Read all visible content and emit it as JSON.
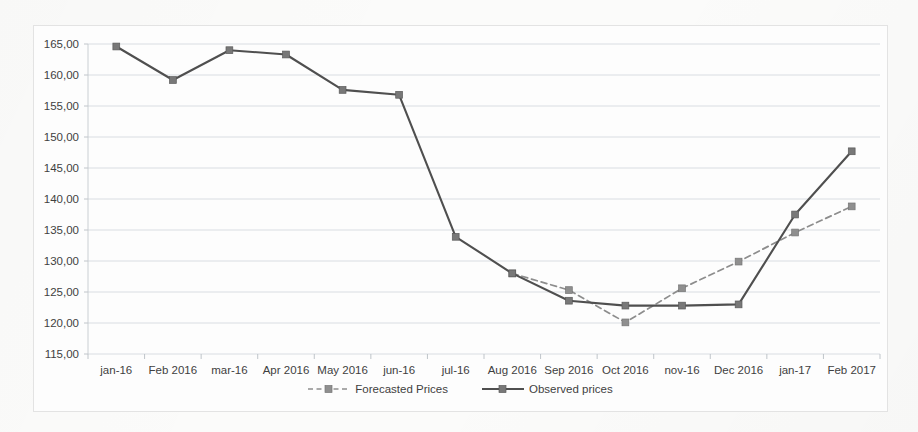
{
  "chart_data": {
    "type": "line",
    "title": "",
    "xlabel": "",
    "ylabel": "",
    "grid": true,
    "legend_position": "bottom-center",
    "ylim": [
      115,
      165
    ],
    "ytick_step": 5,
    "ytick_labels": [
      "115,00",
      "120,00",
      "125,00",
      "130,00",
      "135,00",
      "140,00",
      "145,00",
      "150,00",
      "155,00",
      "160,00",
      "165,00"
    ],
    "ytick_values": [
      115,
      120,
      125,
      130,
      135,
      140,
      145,
      150,
      155,
      160,
      165
    ],
    "categories": [
      "jan-16",
      "Feb 2016",
      "mar-16",
      "Apr 2016",
      "May 2016",
      "jun-16",
      "jul-16",
      "Aug 2016",
      "Sep 2016",
      "Oct 2016",
      "nov-16",
      "Dec 2016",
      "jan-17",
      "Feb 2017"
    ],
    "series": [
      {
        "name": "Forecasted Prices",
        "style": "dashed",
        "marker": "square",
        "color": "#8f8f8f",
        "values": [
          null,
          null,
          null,
          null,
          null,
          null,
          null,
          128.0,
          125.3,
          120.1,
          125.6,
          129.9,
          134.6,
          138.8
        ]
      },
      {
        "name": "Observed prices",
        "style": "solid",
        "marker": "square",
        "color": "#4f4f4f",
        "values": [
          164.6,
          159.2,
          164.0,
          163.3,
          157.6,
          156.8,
          133.9,
          128.0,
          123.6,
          122.8,
          122.8,
          123.0,
          137.5,
          147.7
        ]
      }
    ]
  },
  "legend": {
    "items": [
      {
        "label": "Forecasted Prices",
        "style": "dashed"
      },
      {
        "label": "Observed prices",
        "style": "solid"
      }
    ]
  },
  "colors": {
    "observed": "#4f4f4f",
    "forecast": "#8f8f8f",
    "grid": "#cfd4da",
    "frame": "#e3e3e3",
    "background": "#fdfdfd"
  }
}
